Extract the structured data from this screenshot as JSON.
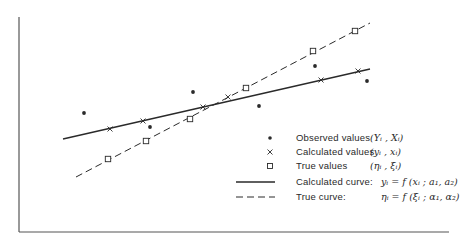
{
  "chart_data": {
    "type": "scatter",
    "title": "",
    "xlabel": "",
    "ylabel": "",
    "grid": false,
    "axes_ticks": "none",
    "legend_position": "lower right",
    "frame": {
      "left": 19,
      "top": 17,
      "right": 449,
      "bottom": 232
    },
    "series": [
      {
        "name": "Observed values",
        "marker": "filled-dot",
        "symbol": "(Y_i, X_i)",
        "points_px": [
          [
            84,
            113
          ],
          [
            150,
            127
          ],
          [
            193,
            92
          ],
          [
            259,
            106
          ],
          [
            315,
            66
          ],
          [
            367,
            81
          ]
        ]
      },
      {
        "name": "Calculated values",
        "marker": "cross",
        "symbol": "(y_i, x_i)",
        "points_px": [
          [
            110,
            129
          ],
          [
            143,
            121
          ],
          [
            203,
            107
          ],
          [
            228,
            97
          ],
          [
            321,
            80
          ],
          [
            358,
            71
          ]
        ]
      },
      {
        "name": "True values",
        "marker": "open-square",
        "symbol": "(eta_i, xi_i)",
        "points_px": [
          [
            108,
            159
          ],
          [
            146,
            141
          ],
          [
            190,
            119
          ],
          [
            246,
            88
          ],
          [
            313,
            51
          ],
          [
            355,
            31
          ]
        ]
      },
      {
        "name": "Calculated curve",
        "line": "solid",
        "equation": "y_i = f(x_i; a_1, a_2)",
        "line_px": [
          [
            63,
            139
          ],
          [
            370,
            69
          ]
        ]
      },
      {
        "name": "True curve",
        "line": "dashed",
        "equation": "eta_i = f(xi_i; alpha_1, alpha_2)",
        "line_px": [
          [
            76,
            177
          ],
          [
            370,
            23
          ]
        ]
      }
    ]
  },
  "legend": {
    "observed": {
      "label": "Observed values",
      "symbol": "(Yᵢ , Xᵢ)"
    },
    "calculated": {
      "label": "Calculated values",
      "symbol": "(yᵢ , xᵢ)"
    },
    "true_vals": {
      "label": "True values",
      "symbol": "(ηᵢ , ξᵢ)"
    },
    "calc_curve": {
      "label": "Calculated curve:",
      "equation": "yᵢ = f (xᵢ ; a₁, a₂)"
    },
    "true_curve": {
      "label": "True curve:",
      "equation": "ηᵢ = f (ξᵢ ; α₁, α₂)"
    }
  },
  "colors": {
    "ink": "#2a2a2a",
    "background": "#ffffff"
  }
}
